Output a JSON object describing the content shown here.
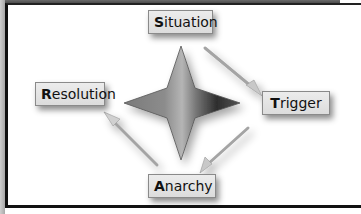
{
  "diagram": {
    "type": "cycle",
    "center_shape": "four-point-star",
    "nodes": [
      {
        "id": "situation",
        "initial": "S",
        "rest": "ituation",
        "label": "Situation",
        "position": "top"
      },
      {
        "id": "trigger",
        "initial": "T",
        "rest": "rigger",
        "label": "Trigger",
        "position": "right"
      },
      {
        "id": "anarchy",
        "initial": "A",
        "rest": "narchy",
        "label": "Anarchy",
        "position": "bottom"
      },
      {
        "id": "resolution",
        "initial": "R",
        "rest": "esolution",
        "label": "Resolution",
        "position": "left"
      }
    ],
    "edges": [
      {
        "from": "Situation",
        "to": "Trigger"
      },
      {
        "from": "Trigger",
        "to": "Anarchy"
      },
      {
        "from": "Anarchy",
        "to": "Resolution"
      }
    ],
    "colors": {
      "box_fill": "#e4e4e4",
      "box_border": "#8a8a8a",
      "star_light": "#9a9a9a",
      "star_dark": "#2a2a2a",
      "arrow": "#a8a8a8",
      "frame": "#111111"
    }
  }
}
